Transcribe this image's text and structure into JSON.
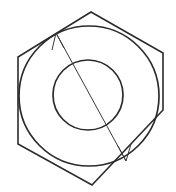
{
  "figure": {
    "background_color": "#ffffff",
    "canvas": {
      "width": 176,
      "height": 192
    },
    "stroke_color": "#1a1a1a",
    "line_color": "#3a3a3a"
  },
  "shapes": {
    "hexagon": {
      "name": "hexagon-outline",
      "orientation": "pointy-top",
      "stroke_color": "#2b2b2b",
      "stroke_width": 1.6,
      "fill": "none",
      "center": {
        "x": 90,
        "y": 98
      },
      "circumradius": 87,
      "points": "91,12 163,53 163,110 92,185 18,144 18,57",
      "vertices": [
        {
          "label": "top",
          "x": 91,
          "y": 12
        },
        {
          "label": "upper-right",
          "x": 163,
          "y": 53
        },
        {
          "label": "lower-right",
          "x": 163,
          "y": 110
        },
        {
          "label": "bottom",
          "x": 92,
          "y": 185
        },
        {
          "label": "lower-left",
          "x": 18,
          "y": 144
        },
        {
          "label": "upper-left",
          "x": 18,
          "y": 57
        }
      ]
    },
    "outer_circle": {
      "name": "outer-circle",
      "center": {
        "x": 89,
        "y": 96
      },
      "radius": 70,
      "stroke_color": "#2b2b2b",
      "stroke_width": 1.7,
      "fill": "none"
    },
    "inner_circle": {
      "name": "inner-circle",
      "center": {
        "x": 88,
        "y": 95
      },
      "radius": 35,
      "stroke_color": "#2b2b2b",
      "stroke_width": 1.7,
      "fill": "none"
    }
  },
  "annotations": {
    "diameter_arrow": {
      "name": "diameter-arrow",
      "type": "double-headed-arrow",
      "stroke_color": "#3a3a3a",
      "stroke_width": 1,
      "start": {
        "x": 56,
        "y": 33
      },
      "end": {
        "x": 126,
        "y": 161
      },
      "arrowheads": [
        {
          "name": "arrowhead-start",
          "tip": {
            "x": 56,
            "y": 33
          },
          "barbs": "64,48 56,33 52,50"
        },
        {
          "name": "arrowhead-end",
          "tip": {
            "x": 126,
            "y": 161
          },
          "barbs": "118,146 126,161 131,144"
        }
      ]
    }
  }
}
